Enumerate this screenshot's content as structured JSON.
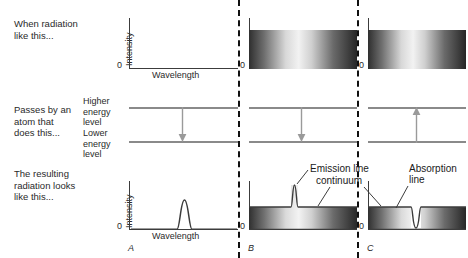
{
  "figure": {
    "type": "diagram",
    "background": "#ffffff",
    "accent_dark": "#3c3c3c",
    "level_color": "#8a8a8a",
    "divider_color": "#111111"
  },
  "row_captions": [
    {
      "id": "row-1",
      "text_line1": "When radiation",
      "text_line2": "like this..."
    },
    {
      "id": "row-2",
      "text_line1": "Passes by an",
      "text_line2": "atom that",
      "text_line3": "does this..."
    },
    {
      "id": "row-3",
      "text_line1": "The resulting",
      "text_line2": "radiation looks",
      "text_line3": "like this..."
    }
  ],
  "axis_labels": {
    "intensity": "Intensity",
    "wavelength": "Wavelength",
    "zero": "0"
  },
  "energy_levels": {
    "higher_line1": "Higher",
    "higher_line2": "energy",
    "higher_line3": "level",
    "lower_line1": "Lower",
    "lower_line2": "energy",
    "lower_line3": "level"
  },
  "panels": [
    {
      "letter": "A",
      "incoming": {
        "kind": "empty-plot",
        "description": "no incoming radiation",
        "has_continuum": false
      },
      "transition": {
        "direction": "down",
        "meaning": "electron drops from higher to lower energy level, emitting a photon"
      },
      "result": {
        "kind": "emission-peak-on-zero",
        "description": "single bright emission line on a dark background",
        "has_continuum": false,
        "peak": true,
        "dip": false
      }
    },
    {
      "letter": "B",
      "incoming": {
        "kind": "continuum",
        "description": "continuous spectrum (continuum)",
        "has_continuum": true
      },
      "transition": {
        "direction": "down",
        "meaning": "electron drops from higher to lower energy level, emitting a photon"
      },
      "result": {
        "kind": "continuum-with-emission-line",
        "description": "continuum plus a bright emission line",
        "has_continuum": true,
        "peak": true,
        "dip": false
      }
    },
    {
      "letter": "C",
      "incoming": {
        "kind": "continuum",
        "description": "continuous spectrum (continuum)",
        "has_continuum": true
      },
      "transition": {
        "direction": "up",
        "meaning": "electron is lifted from lower to higher energy level, absorbing a photon"
      },
      "result": {
        "kind": "continuum-with-absorption-line",
        "description": "continuum with a dark absorption line",
        "has_continuum": true,
        "peak": false,
        "dip": true
      }
    }
  ],
  "annotations": [
    {
      "id": "emission-line",
      "text": "Emission line"
    },
    {
      "id": "continuum",
      "text": "continuum"
    },
    {
      "id": "absorption-line-l1",
      "text": "Absorption"
    },
    {
      "id": "absorption-line-l2",
      "text": "line"
    }
  ]
}
